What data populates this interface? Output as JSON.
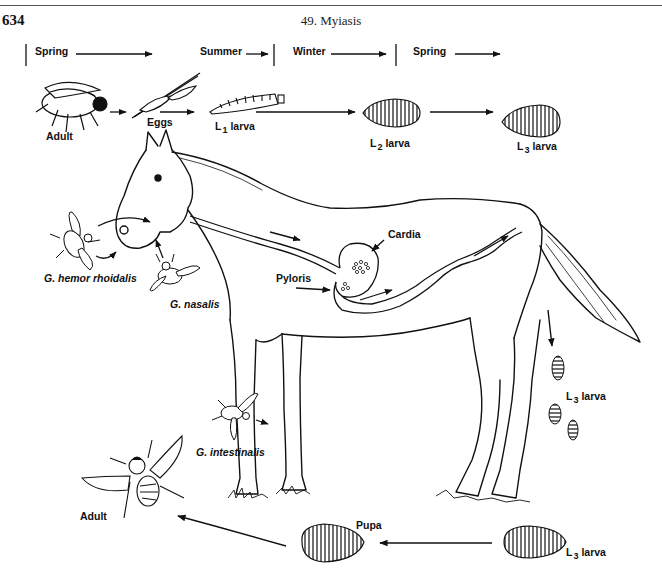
{
  "header": {
    "page_number": "634",
    "chapter_title": "49. Myiasis"
  },
  "seasons": [
    {
      "label": "Spring",
      "icon": "arrow-right-icon"
    },
    {
      "label": "Summer",
      "icon": "arrow-right-icon"
    },
    {
      "label": "Winter",
      "icon": "arrow-right-icon"
    },
    {
      "label": "Spring",
      "icon": "arrow-right-icon"
    }
  ],
  "top_stages": {
    "adult": "Adult",
    "eggs": "Eggs",
    "l1": {
      "prefix": "L",
      "sub": "1",
      "suffix": "larva"
    },
    "l2": {
      "prefix": "L",
      "sub": "2",
      "suffix": "larva"
    },
    "l3": {
      "prefix": "L",
      "sub": "3",
      "suffix": "larva"
    }
  },
  "species": {
    "hemorrhoidalis": "G. hemor rhoidalis",
    "nasalis": "G. nasalis",
    "intestinalis": "G. intestinalis"
  },
  "anatomy": {
    "cardia": "Cardia",
    "pyloris": "Pyloris"
  },
  "dropped_larvae": {
    "prefix": "L",
    "sub": "3",
    "suffix": "larva"
  },
  "bottom_stages": {
    "adult": "Adult",
    "pupa": "Pupa",
    "l3": {
      "prefix": "L",
      "sub": "3",
      "suffix": "larva"
    }
  },
  "colors": {
    "ink": "#111111",
    "paper": "#ffffff",
    "rule": "#555555"
  }
}
